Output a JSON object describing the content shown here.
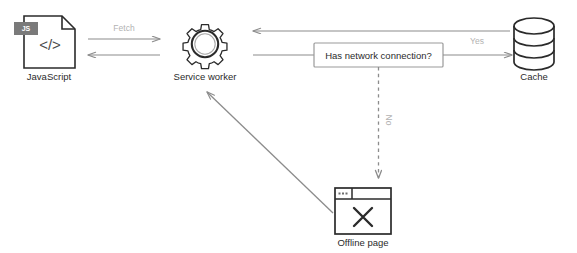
{
  "diagram": {
    "colors": {
      "node_stroke": "#2b2b2b",
      "arrow_gray": "#8c8c8c",
      "label_gray": "#b3b3b3",
      "box_border": "#9a9a9a",
      "badge_bg": "#7a7a7a",
      "background": "#ffffff"
    },
    "nodes": [
      {
        "id": "javascript",
        "label": "JavaScript",
        "icon": "file-code-icon",
        "badge": "JS",
        "code_glyph": "</>"
      },
      {
        "id": "service-worker",
        "label": "Service worker",
        "icon": "gear-icon"
      },
      {
        "id": "cache",
        "label": "Cache",
        "icon": "database-cylinder-icon"
      },
      {
        "id": "offline-page",
        "label": "Offline page",
        "icon": "browser-window-error-icon",
        "glyph": "✕"
      }
    ],
    "decision": {
      "id": "has-network-connection",
      "label": "Has network connection?"
    },
    "edges": [
      {
        "id": "fetch-request",
        "label": "Fetch",
        "from": "javascript",
        "to": "service-worker",
        "style": "solid",
        "direction": "right"
      },
      {
        "id": "fetch-response",
        "label": "",
        "from": "service-worker",
        "to": "javascript",
        "style": "solid",
        "direction": "left"
      },
      {
        "id": "cache-response",
        "label": "",
        "from": "cache",
        "to": "service-worker",
        "style": "solid",
        "direction": "left"
      },
      {
        "id": "network-check",
        "label": "",
        "from": "service-worker",
        "to": "has-network-connection",
        "style": "solid",
        "direction": "none"
      },
      {
        "id": "network-yes",
        "label": "Yes",
        "from": "has-network-connection",
        "to": "cache",
        "style": "solid",
        "direction": "right"
      },
      {
        "id": "network-no",
        "label": "No",
        "from": "has-network-connection",
        "to": "offline-page",
        "style": "dashed",
        "direction": "down"
      },
      {
        "id": "offline-fallback",
        "label": "",
        "from": "offline-page",
        "to": "service-worker",
        "style": "solid",
        "direction": "up-left"
      }
    ]
  }
}
